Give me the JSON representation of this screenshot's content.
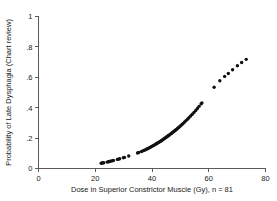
{
  "chart_data": {
    "type": "scatter",
    "title": "",
    "xlabel": "Dose in Superior Constrictor Muscle (Gy), n = 81",
    "ylabel": "Probability of Late Dysphagia (Chart review)",
    "xlim": [
      0,
      80
    ],
    "ylim": [
      0,
      1
    ],
    "xticks": [
      0,
      20,
      40,
      60,
      80
    ],
    "xticklabels": [
      "0",
      "20",
      "40",
      "60",
      "80"
    ],
    "yticks": [
      0,
      0.2,
      0.4,
      0.6,
      0.8,
      1
    ],
    "yticklabels": [
      "0",
      ".2",
      ".4",
      ".6",
      ".8",
      "1"
    ],
    "grid": false,
    "legend": null,
    "marker": "filled-circle",
    "marker_color": "#111111",
    "marker_size": 1.7,
    "n": 81,
    "x": [
      22.1,
      22.4,
      22.7,
      23.0,
      24.2,
      24.6,
      25.0,
      25.4,
      26.0,
      26.4,
      27.8,
      28.2,
      28.6,
      29.9,
      30.3,
      31.8,
      34.9,
      35.3,
      36.3,
      36.8,
      37.3,
      37.8,
      38.2,
      38.6,
      39.0,
      39.4,
      39.8,
      40.2,
      40.6,
      41.0,
      41.4,
      41.7,
      42.0,
      42.4,
      42.7,
      43.0,
      43.3,
      43.6,
      43.9,
      44.2,
      44.5,
      44.8,
      45.1,
      45.4,
      45.7,
      46.0,
      46.3,
      46.6,
      46.9,
      47.2,
      47.5,
      47.8,
      48.1,
      48.4,
      48.7,
      49.0,
      49.4,
      49.8,
      50.2,
      50.6,
      51.0,
      51.5,
      52.0,
      52.5,
      53.0,
      53.6,
      54.2,
      54.8,
      55.4,
      56.0,
      56.6,
      57.3,
      57.6,
      61.9,
      63.9,
      65.6,
      66.9,
      68.4,
      70.1,
      71.6,
      73.2
    ],
    "y": [
      0.035,
      0.036,
      0.037,
      0.038,
      0.042,
      0.044,
      0.046,
      0.048,
      0.051,
      0.053,
      0.06,
      0.062,
      0.064,
      0.071,
      0.073,
      0.082,
      0.102,
      0.105,
      0.112,
      0.116,
      0.12,
      0.124,
      0.128,
      0.132,
      0.136,
      0.14,
      0.144,
      0.148,
      0.152,
      0.157,
      0.161,
      0.165,
      0.168,
      0.172,
      0.176,
      0.18,
      0.183,
      0.187,
      0.191,
      0.195,
      0.199,
      0.203,
      0.207,
      0.211,
      0.215,
      0.219,
      0.223,
      0.228,
      0.232,
      0.236,
      0.241,
      0.245,
      0.25,
      0.254,
      0.259,
      0.264,
      0.27,
      0.277,
      0.283,
      0.29,
      0.297,
      0.306,
      0.315,
      0.324,
      0.334,
      0.345,
      0.357,
      0.369,
      0.382,
      0.395,
      0.409,
      0.425,
      0.432,
      0.535,
      0.577,
      0.606,
      0.625,
      0.65,
      0.676,
      0.697,
      0.718
    ]
  },
  "axes": {
    "x_axis_name": "x-axis",
    "y_axis_name": "y-axis"
  }
}
